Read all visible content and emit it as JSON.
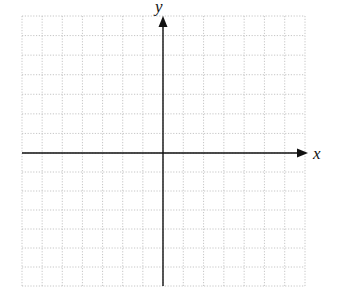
{
  "diagram": {
    "type": "coordinate-plane",
    "x_axis_label": "x",
    "y_axis_label": "y",
    "grid": {
      "cells_left": 7,
      "cells_right": 7,
      "cells_up": 7,
      "cells_down": 7,
      "line_style": "dotted",
      "line_color": "#b8b8b8"
    },
    "axis_color": "#111111",
    "ticks_labeled": false
  }
}
